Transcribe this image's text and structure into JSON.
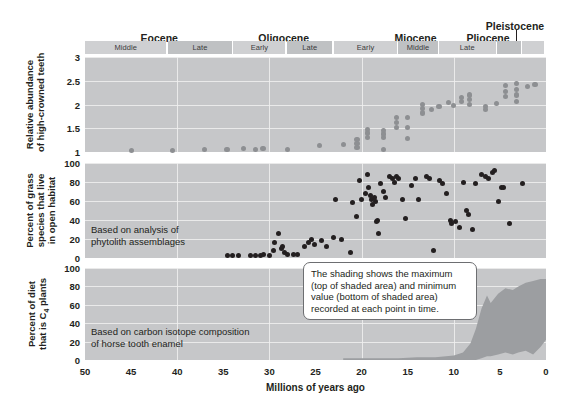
{
  "timescale": {
    "epochs": [
      {
        "name": "Eocene",
        "start_ma": 50.0,
        "end_ma": 33.9
      },
      {
        "name": "Oligocene",
        "start_ma": 33.9,
        "end_ma": 23.0
      },
      {
        "name": "Miocene",
        "start_ma": 23.0,
        "end_ma": 5.3
      },
      {
        "name": "Pliocene",
        "start_ma": 5.3,
        "end_ma": 2.6
      },
      {
        "name": "Pleistocene",
        "start_ma": 2.6,
        "end_ma": 0.0
      }
    ],
    "subepochs": [
      {
        "label": "Middle",
        "start_ma": 50.0,
        "end_ma": 41.0
      },
      {
        "label": "Late",
        "start_ma": 41.0,
        "end_ma": 33.9
      },
      {
        "label": "Early",
        "start_ma": 33.9,
        "end_ma": 28.1
      },
      {
        "label": "Late",
        "start_ma": 28.1,
        "end_ma": 23.0
      },
      {
        "label": "Early",
        "start_ma": 23.0,
        "end_ma": 16.0
      },
      {
        "label": "Middle",
        "start_ma": 16.0,
        "end_ma": 11.6
      },
      {
        "label": "Late",
        "start_ma": 11.6,
        "end_ma": 5.3
      },
      {
        "label": "",
        "start_ma": 5.3,
        "end_ma": 2.6
      },
      {
        "label": "",
        "start_ma": 2.6,
        "end_ma": 0.0
      }
    ]
  },
  "xaxis": {
    "title": "Millions of years ago",
    "ticks": [
      50,
      45,
      40,
      35,
      30,
      25,
      20,
      15,
      10,
      5,
      0
    ],
    "min_ma": 50,
    "max_ma": 0,
    "reversed": true
  },
  "chart_data": [
    {
      "type": "scatter",
      "panel": 1,
      "title": "Relative abundance of high-crowned teeth",
      "ylabel": "Relative abundance\nof high-crowned teeth",
      "xlabel": "Millions of years ago",
      "ylim": [
        1.0,
        3.0
      ],
      "yticks": [
        1.0,
        1.5,
        2.0,
        2.5,
        3.0
      ],
      "grid": true,
      "marker_color": "#8d8f92",
      "points": [
        {
          "x": 45.0,
          "y": 1.03
        },
        {
          "x": 40.5,
          "y": 1.03
        },
        {
          "x": 37.0,
          "y": 1.06
        },
        {
          "x": 34.6,
          "y": 1.06
        },
        {
          "x": 32.8,
          "y": 1.08
        },
        {
          "x": 31.5,
          "y": 1.06
        },
        {
          "x": 30.7,
          "y": 1.08
        },
        {
          "x": 28.0,
          "y": 1.06
        },
        {
          "x": 24.6,
          "y": 1.13
        },
        {
          "x": 22.0,
          "y": 1.15
        },
        {
          "x": 20.5,
          "y": 1.1
        },
        {
          "x": 20.5,
          "y": 1.18
        },
        {
          "x": 20.5,
          "y": 1.26
        },
        {
          "x": 19.4,
          "y": 1.3
        },
        {
          "x": 19.4,
          "y": 1.4
        },
        {
          "x": 19.4,
          "y": 1.48
        },
        {
          "x": 17.6,
          "y": 1.05
        },
        {
          "x": 17.6,
          "y": 1.3
        },
        {
          "x": 17.6,
          "y": 1.38
        },
        {
          "x": 17.6,
          "y": 1.46
        },
        {
          "x": 16.2,
          "y": 1.52
        },
        {
          "x": 16.2,
          "y": 1.62
        },
        {
          "x": 16.2,
          "y": 1.72
        },
        {
          "x": 15.0,
          "y": 1.28
        },
        {
          "x": 15.0,
          "y": 1.52
        },
        {
          "x": 15.0,
          "y": 1.72
        },
        {
          "x": 13.4,
          "y": 1.92
        },
        {
          "x": 13.4,
          "y": 2.0
        },
        {
          "x": 13.4,
          "y": 1.82
        },
        {
          "x": 12.4,
          "y": 1.9
        },
        {
          "x": 11.6,
          "y": 1.96
        },
        {
          "x": 10.6,
          "y": 2.04
        },
        {
          "x": 10.0,
          "y": 1.98
        },
        {
          "x": 9.2,
          "y": 2.14
        },
        {
          "x": 9.2,
          "y": 2.06
        },
        {
          "x": 8.3,
          "y": 2.2
        },
        {
          "x": 8.3,
          "y": 2.1
        },
        {
          "x": 8.3,
          "y": 2.0
        },
        {
          "x": 6.6,
          "y": 1.96
        },
        {
          "x": 6.6,
          "y": 1.9
        },
        {
          "x": 5.4,
          "y": 2.02
        },
        {
          "x": 4.4,
          "y": 2.4
        },
        {
          "x": 4.4,
          "y": 2.28
        },
        {
          "x": 4.4,
          "y": 2.16
        },
        {
          "x": 3.2,
          "y": 2.44
        },
        {
          "x": 3.2,
          "y": 2.32
        },
        {
          "x": 3.2,
          "y": 2.2
        },
        {
          "x": 3.2,
          "y": 2.06
        },
        {
          "x": 2.0,
          "y": 2.38
        },
        {
          "x": 1.2,
          "y": 2.42
        }
      ]
    },
    {
      "type": "scatter",
      "panel": 2,
      "title": "Percent of grass species that live in open habitat",
      "ylabel": "Percent of grass\nspecies that live\nin open habitat",
      "xlabel": "Millions of years ago",
      "ylim": [
        0,
        100
      ],
      "yticks": [
        0,
        20,
        40,
        60,
        80,
        100
      ],
      "grid": true,
      "marker_color": "#231f20",
      "annotation": "Based on analysis of\nphytolith assemblages",
      "points": [
        {
          "x": 34.5,
          "y": 3
        },
        {
          "x": 34.0,
          "y": 3
        },
        {
          "x": 33.3,
          "y": 3
        },
        {
          "x": 32.0,
          "y": 3
        },
        {
          "x": 31.5,
          "y": 3
        },
        {
          "x": 31.0,
          "y": 3
        },
        {
          "x": 30.6,
          "y": 4
        },
        {
          "x": 30.0,
          "y": 3
        },
        {
          "x": 29.6,
          "y": 8
        },
        {
          "x": 29.4,
          "y": 16
        },
        {
          "x": 29.0,
          "y": 26
        },
        {
          "x": 28.7,
          "y": 10
        },
        {
          "x": 28.6,
          "y": 12
        },
        {
          "x": 28.4,
          "y": 6
        },
        {
          "x": 28.0,
          "y": 4
        },
        {
          "x": 27.4,
          "y": 4
        },
        {
          "x": 26.9,
          "y": 4
        },
        {
          "x": 26.2,
          "y": 12
        },
        {
          "x": 25.8,
          "y": 16
        },
        {
          "x": 25.4,
          "y": 20
        },
        {
          "x": 25.1,
          "y": 14
        },
        {
          "x": 24.4,
          "y": 18
        },
        {
          "x": 23.8,
          "y": 12
        },
        {
          "x": 23.0,
          "y": 22
        },
        {
          "x": 22.2,
          "y": 20
        },
        {
          "x": 21.2,
          "y": 6
        },
        {
          "x": 21.0,
          "y": 58
        },
        {
          "x": 20.6,
          "y": 44
        },
        {
          "x": 20.2,
          "y": 82
        },
        {
          "x": 20.0,
          "y": 62
        },
        {
          "x": 19.6,
          "y": 68
        },
        {
          "x": 19.4,
          "y": 88
        },
        {
          "x": 19.2,
          "y": 74
        },
        {
          "x": 19.0,
          "y": 66
        },
        {
          "x": 18.9,
          "y": 62
        },
        {
          "x": 18.8,
          "y": 56
        },
        {
          "x": 18.6,
          "y": 64
        },
        {
          "x": 18.5,
          "y": 60
        },
        {
          "x": 18.4,
          "y": 38
        },
        {
          "x": 18.3,
          "y": 40
        },
        {
          "x": 18.2,
          "y": 26
        },
        {
          "x": 18.0,
          "y": 78
        },
        {
          "x": 17.6,
          "y": 70
        },
        {
          "x": 17.4,
          "y": 64
        },
        {
          "x": 17.0,
          "y": 86
        },
        {
          "x": 16.6,
          "y": 84
        },
        {
          "x": 16.4,
          "y": 80
        },
        {
          "x": 16.2,
          "y": 86
        },
        {
          "x": 16.0,
          "y": 84
        },
        {
          "x": 15.6,
          "y": 62
        },
        {
          "x": 15.2,
          "y": 42
        },
        {
          "x": 14.6,
          "y": 76
        },
        {
          "x": 14.2,
          "y": 84
        },
        {
          "x": 13.8,
          "y": 62
        },
        {
          "x": 13.0,
          "y": 86
        },
        {
          "x": 12.6,
          "y": 84
        },
        {
          "x": 12.2,
          "y": 8
        },
        {
          "x": 11.6,
          "y": 82
        },
        {
          "x": 11.2,
          "y": 78
        },
        {
          "x": 10.8,
          "y": 68
        },
        {
          "x": 10.4,
          "y": 40
        },
        {
          "x": 10.2,
          "y": 36
        },
        {
          "x": 9.8,
          "y": 38
        },
        {
          "x": 9.4,
          "y": 32
        },
        {
          "x": 9.0,
          "y": 80
        },
        {
          "x": 8.6,
          "y": 50
        },
        {
          "x": 8.4,
          "y": 46
        },
        {
          "x": 8.0,
          "y": 30
        },
        {
          "x": 7.6,
          "y": 78
        },
        {
          "x": 7.0,
          "y": 88
        },
        {
          "x": 6.6,
          "y": 86
        },
        {
          "x": 6.2,
          "y": 84
        },
        {
          "x": 5.8,
          "y": 90
        },
        {
          "x": 5.6,
          "y": 92
        },
        {
          "x": 5.2,
          "y": 60
        },
        {
          "x": 4.8,
          "y": 74
        },
        {
          "x": 4.6,
          "y": 74
        },
        {
          "x": 4.0,
          "y": 36
        },
        {
          "x": 2.6,
          "y": 78
        },
        {
          "x": 22.8,
          "y": 62
        }
      ]
    },
    {
      "type": "area",
      "panel": 3,
      "title": "Percent of diet that is C4 plants",
      "ylabel": "Percent of diet\nthat is C₄ plants",
      "xlabel": "Millions of years ago",
      "ylim": [
        0,
        100
      ],
      "yticks": [
        0,
        20,
        40,
        60,
        80,
        100
      ],
      "grid": true,
      "fill_color": "#9c9ea1",
      "annotation": "Based on carbon isotope composition\nof horse tooth enamel",
      "x": [
        22,
        20,
        18,
        16,
        14,
        12,
        10,
        9,
        8.2,
        7.6,
        7.0,
        6.4,
        6.0,
        5.2,
        4.4,
        3.6,
        3.0,
        2.2,
        1.4,
        0.6,
        0.0
      ],
      "max": [
        2,
        2,
        2,
        2,
        3,
        3,
        5,
        8,
        18,
        34,
        56,
        70,
        62,
        72,
        78,
        76,
        80,
        84,
        86,
        88,
        88
      ],
      "min": [
        0,
        0,
        0,
        0,
        0,
        0,
        0,
        0,
        0,
        0,
        2,
        4,
        4,
        6,
        8,
        6,
        8,
        10,
        6,
        14,
        22
      ]
    }
  ],
  "callout": {
    "text": "The shading shows the maximum\n(top of shaded area) and minimum\nvalue (bottom of shaded area)\nrecorded at each point in time."
  },
  "colors": {
    "panel_bg": "#c6c7c9",
    "epoch_bar": "#cfd0d2",
    "epoch_bar_alt": "#bfc1c3",
    "grid": "#f0f0f0",
    "dot_panel1": "#8d8f92",
    "dot_panel2": "#231f20",
    "shading": "#9c9ea1",
    "text": "#231f20",
    "page_bg": "#ffffff"
  }
}
